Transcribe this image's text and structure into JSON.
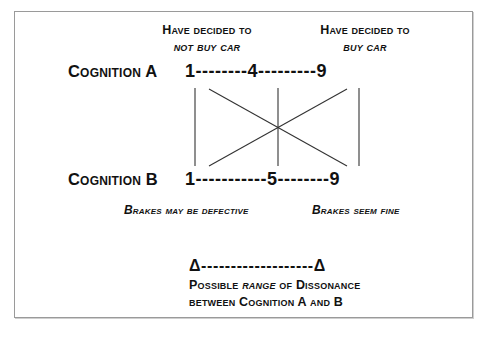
{
  "headers": {
    "left": {
      "line1": "Have decided to",
      "line2": "not buy car"
    },
    "right": {
      "line1": "Have decided to",
      "line2": "buy car"
    }
  },
  "cognition_a": {
    "label": "Cognition A",
    "scale": "1--------4---------9",
    "values": [
      1,
      4,
      9
    ]
  },
  "cognition_b": {
    "label": "Cognition B",
    "scale": "1-----------5--------9",
    "values": [
      1,
      5,
      9
    ]
  },
  "captions": {
    "left": "Brakes may be defective",
    "right": "Brakes seem fine"
  },
  "range": {
    "marker": "Δ-------------------Δ",
    "line1_pre": "Possible ",
    "line1_em": "range",
    "line1_post": " of Dissonance",
    "line2": "between Cognition A and B"
  },
  "colors": {
    "stroke": "#333333",
    "border": "#9a9a9a",
    "text": "#111111"
  }
}
